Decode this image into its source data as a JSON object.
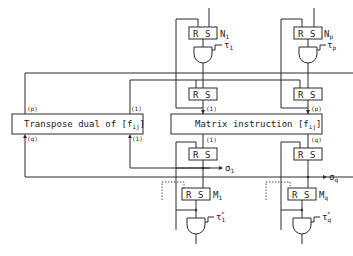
{
  "diagram": {
    "blocks": {
      "transpose": {
        "label": "Transpose dual of [f",
        "sub": "ij",
        "close": "]"
      },
      "matrix": {
        "label": "Matrix instruction [f",
        "sub": "ij",
        "close": "]"
      }
    },
    "flipflops": {
      "n1": {
        "r": "R",
        "s": "S",
        "name": "N",
        "sub": "1"
      },
      "np": {
        "r": "R",
        "s": "S",
        "name": "N",
        "sub": "p"
      },
      "mid1": {
        "r": "R",
        "s": "S"
      },
      "midp": {
        "r": "R",
        "s": "S"
      },
      "low1": {
        "r": "R",
        "s": "S"
      },
      "lowq": {
        "r": "R",
        "s": "S"
      },
      "m1": {
        "r": "R",
        "s": "S",
        "name": "M",
        "sub": "1"
      },
      "mq": {
        "r": "R",
        "s": "S",
        "name": "M",
        "sub": "q"
      }
    },
    "signals": {
      "tau1": {
        "sym": "τ",
        "sub": "1"
      },
      "taup": {
        "sym": "τ",
        "sub": "p"
      },
      "tau1s": {
        "sym": "τ",
        "sub": "1",
        "sup": "*"
      },
      "tauqs": {
        "sym": "τ",
        "sub": "q",
        "sup": "*"
      },
      "o1": {
        "sym": "σ",
        "sub": "1"
      },
      "oq": {
        "sym": "σ",
        "sub": "q"
      }
    },
    "port_labels": {
      "transpose_top_left": "(p)",
      "transpose_top_right": "(1)",
      "transpose_bot_left": "(q)",
      "transpose_bot_right": "(1)",
      "matrix_top_left": "(1)",
      "matrix_top_right": "(p)",
      "matrix_bot_left": "(1)",
      "matrix_bot_right": "(q)"
    }
  }
}
